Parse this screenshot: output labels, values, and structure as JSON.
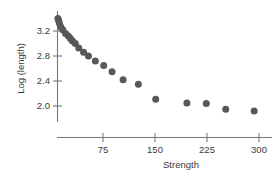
{
  "chart_data": {
    "type": "scatter",
    "title": "",
    "xlabel": "Strength",
    "ylabel": "Log (length)",
    "xlim": [
      0,
      310
    ],
    "ylim": [
      1.78,
      3.45
    ],
    "grid": false,
    "legend": null,
    "xticks": [
      75,
      150,
      225,
      300
    ],
    "xtick_labels": [
      "75",
      "150",
      "225",
      "300"
    ],
    "yticks": [
      2.0,
      2.4,
      2.8,
      3.2
    ],
    "ytick_labels": [
      "2.0",
      "2.4",
      "2.8",
      "3.2"
    ],
    "marker": {
      "shape": "circle",
      "color": "#585858",
      "size": 4.6
    },
    "series": [
      {
        "name": "observations",
        "x": [
          10,
          11,
          12,
          14,
          17,
          21,
          25,
          28,
          31,
          35,
          40,
          47,
          54,
          64,
          76,
          88,
          104,
          126,
          151,
          196,
          224,
          252,
          293
        ],
        "y": [
          3.4,
          3.37,
          3.33,
          3.27,
          3.22,
          3.16,
          3.12,
          3.08,
          3.04,
          3.0,
          2.93,
          2.86,
          2.8,
          2.72,
          2.65,
          2.55,
          2.42,
          2.35,
          2.11,
          2.05,
          2.04,
          1.95,
          1.92
        ]
      }
    ]
  },
  "axis": {
    "xlabel": "Strength",
    "ylabel": "Log (length)"
  }
}
